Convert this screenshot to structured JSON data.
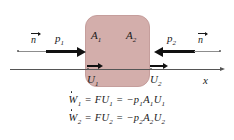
{
  "figure": {
    "background_color": "#ffffff",
    "control_volume": {
      "name": "control-volume",
      "fill_color": "#d3aeab",
      "border_color": "#c59e9c"
    },
    "axis": {
      "label": "x",
      "color": "#555555"
    },
    "labels": {
      "area_left": "A",
      "area_left_sub": "1",
      "area_right": "A",
      "area_right_sub": "2",
      "pressure_left": "p",
      "pressure_left_sub": "1",
      "pressure_right": "p",
      "pressure_right_sub": "2",
      "velocity_left": "U",
      "velocity_left_sub": "1",
      "velocity_right": "U",
      "velocity_right_sub": "2",
      "normal_left": "n",
      "normal_right": "n"
    },
    "equations": [
      {
        "work": "W",
        "work_sub": "1",
        "middle": "= FU",
        "middle_sub": "1",
        "right": "= −p",
        "right_sub1": "1",
        "right_mid": "A",
        "right_sub2": "1",
        "right_end": "U",
        "right_sub3": "1",
        "plain": "Ẇ₁ = FU₁ = −p₁A₁U₁"
      },
      {
        "work": "W",
        "work_sub": "2",
        "middle": "= FU",
        "middle_sub": "2",
        "right": "= −p",
        "right_sub1": "2",
        "right_mid": "A",
        "right_sub2": "2",
        "right_end": "U",
        "right_sub3": "2",
        "plain": "Ẇ₂ = FU₂ = −p₂A₂U₂"
      }
    ]
  }
}
